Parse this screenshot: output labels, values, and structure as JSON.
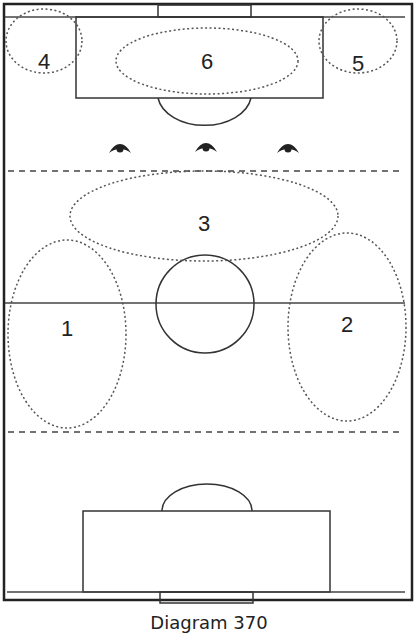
{
  "diagram": {
    "caption": "Diagram 370",
    "type": "soccer/futsal half-court zones diagram",
    "zones": [
      {
        "id": "1",
        "label": "1",
        "description": "left wing, spans halfway line"
      },
      {
        "id": "2",
        "label": "2",
        "description": "right wing, spans halfway line"
      },
      {
        "id": "3",
        "label": "3",
        "description": "central zone above centre circle"
      },
      {
        "id": "4",
        "label": "4",
        "description": "top-left corner"
      },
      {
        "id": "5",
        "label": "5",
        "description": "top-right corner"
      },
      {
        "id": "6",
        "label": "6",
        "description": "inside top penalty area"
      }
    ],
    "players": [
      {
        "id": "p1",
        "icon": "player-icon"
      },
      {
        "id": "p2",
        "icon": "player-icon"
      },
      {
        "id": "p3",
        "icon": "player-icon"
      }
    ],
    "colors": {
      "line": "#333333",
      "dotted": "#555555",
      "background": "#ffffff"
    }
  }
}
